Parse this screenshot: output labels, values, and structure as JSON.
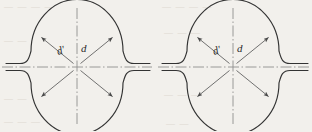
{
  "figure": {
    "name": "circular-component-cross-section-pair",
    "background_color": "#f2f0ec",
    "line_color": "#3a3a3a",
    "centerline_color": "#8a8a8a",
    "dimension_color": "#555555",
    "views": [
      {
        "id": "left-view",
        "name": "left-circular-profile-view",
        "center": {
          "x": 77,
          "y": 67
        },
        "radius_x": 45,
        "radius_y": 51,
        "labels": [
          {
            "id": "d-prime",
            "text": "d′",
            "x": 61,
            "y": 53
          },
          {
            "id": "d",
            "text": "d",
            "x": 82,
            "y": 50
          }
        ],
        "dimension_lines": [
          {
            "id": "diagonal-d-prime",
            "from_angle_deg": 145,
            "to_angle_deg": 325,
            "arrows": "both"
          },
          {
            "id": "diagonal-d",
            "from_angle_deg": 35,
            "to_angle_deg": 215,
            "arrows": "both"
          }
        ]
      },
      {
        "id": "right-view",
        "name": "right-circular-profile-view",
        "center": {
          "x": 233,
          "y": 67
        },
        "radius_x": 45,
        "radius_y": 51,
        "labels": [
          {
            "id": "d-prime",
            "text": "d′",
            "x": 217,
            "y": 53
          },
          {
            "id": "d",
            "text": "d",
            "x": 238,
            "y": 50
          }
        ],
        "dimension_lines": [
          {
            "id": "diagonal-d-prime",
            "from_angle_deg": 145,
            "to_angle_deg": 325,
            "arrows": "both"
          },
          {
            "id": "diagonal-d",
            "from_angle_deg": 35,
            "to_angle_deg": 215,
            "arrows": "both"
          }
        ]
      }
    ],
    "centerlines": {
      "horizontal_label": "horizontal-centerline",
      "vertical_label": "vertical-centerline",
      "style": "dash-dot"
    },
    "bleed_through_artifacts": [
      {
        "text": "—  —  —",
        "x": 4,
        "y": 6
      },
      {
        "text": "— — — —",
        "x": 160,
        "y": 4
      },
      {
        "text": "—  —",
        "x": 6,
        "y": 40
      },
      {
        "text": "— — —",
        "x": 160,
        "y": 30
      },
      {
        "text": "— —",
        "x": 6,
        "y": 96
      },
      {
        "text": "— — —",
        "x": 162,
        "y": 92
      },
      {
        "text": "—  —  —",
        "x": 6,
        "y": 118
      },
      {
        "text": "— — —",
        "x": 164,
        "y": 120
      }
    ]
  }
}
